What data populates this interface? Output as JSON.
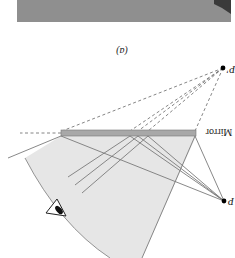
{
  "figure": {
    "orientation": "rotated-180",
    "panel_label": "(a)",
    "mirror_label": "Mirror",
    "object_label": "P",
    "image_label": "P'",
    "colors": {
      "background": "#ffffff",
      "fan_fill": "#e6e6e6",
      "ray": "#7a7a7a",
      "mirror_fill": "#a8a8a8",
      "photo": "#8f8f8f",
      "dot": "#000000"
    }
  }
}
